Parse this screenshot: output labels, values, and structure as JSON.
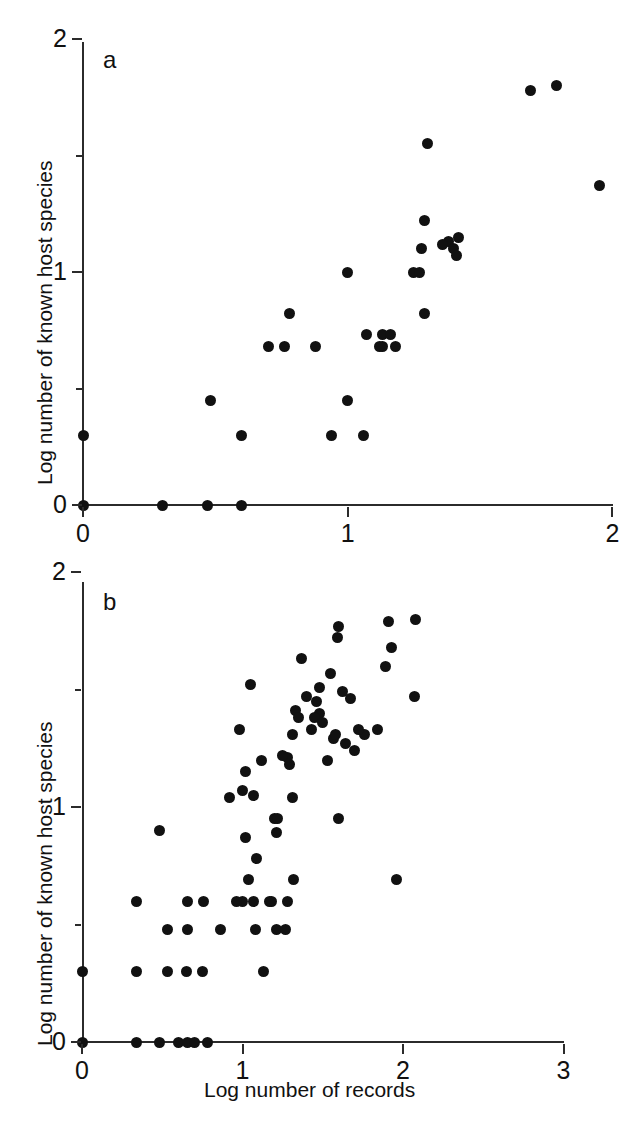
{
  "figure": {
    "axis_titles": {
      "x": "Log number of records",
      "y": "Log number of known host species"
    },
    "panel_labels": {
      "a": "a",
      "b": "b"
    }
  },
  "chart_data": [
    {
      "type": "scatter",
      "panel": "a",
      "title": "a",
      "xlabel": "",
      "ylabel": "Log number of known host species",
      "xlim": [
        0,
        2
      ],
      "ylim": [
        0,
        2
      ],
      "xticks": [
        0,
        1,
        2
      ],
      "xtick_labels": [
        "0",
        "1",
        "2"
      ],
      "yticks": [
        0,
        1,
        2
      ],
      "ytick_labels": [
        "0",
        "1",
        "2"
      ],
      "minor_yticks": [
        0.5,
        1.5
      ],
      "grid": false,
      "legend": false,
      "marker": "filled-circle",
      "marker_color": "#111111",
      "n_points": 35,
      "points": [
        [
          0.0,
          0.3
        ],
        [
          0.0,
          0.0
        ],
        [
          0.3,
          0.0
        ],
        [
          0.47,
          0.0
        ],
        [
          0.6,
          0.0
        ],
        [
          0.48,
          0.45
        ],
        [
          0.6,
          0.3
        ],
        [
          0.7,
          0.68
        ],
        [
          0.78,
          0.82
        ],
        [
          0.76,
          0.68
        ],
        [
          0.94,
          0.3
        ],
        [
          1.0,
          1.0
        ],
        [
          1.0,
          0.45
        ],
        [
          1.06,
          0.3
        ],
        [
          1.07,
          0.73
        ],
        [
          1.13,
          0.73
        ],
        [
          1.13,
          0.68
        ],
        [
          1.18,
          0.68
        ],
        [
          1.25,
          1.0
        ],
        [
          1.28,
          1.1
        ],
        [
          1.29,
          0.82
        ],
        [
          1.29,
          1.22
        ],
        [
          1.3,
          1.55
        ],
        [
          1.38,
          1.13
        ],
        [
          1.4,
          1.1
        ],
        [
          1.41,
          1.07
        ],
        [
          1.42,
          1.15
        ],
        [
          1.69,
          1.78
        ],
        [
          1.79,
          1.8
        ],
        [
          1.95,
          1.37
        ],
        [
          1.12,
          0.68
        ],
        [
          0.88,
          0.68
        ],
        [
          1.36,
          1.12
        ],
        [
          1.27,
          1.0
        ],
        [
          1.16,
          0.73
        ]
      ]
    },
    {
      "type": "scatter",
      "panel": "b",
      "title": "b",
      "xlabel": "Log number of records",
      "ylabel": "Log number of known host species",
      "xlim": [
        0,
        3
      ],
      "ylim": [
        0,
        2
      ],
      "xticks": [
        0,
        1,
        2,
        3
      ],
      "xtick_labels": [
        "0",
        "1",
        "2",
        "3"
      ],
      "yticks": [
        0,
        1,
        2
      ],
      "ytick_labels": [
        "0",
        "1",
        "2"
      ],
      "minor_yticks": [
        0.5,
        1.5
      ],
      "grid": false,
      "legend": false,
      "marker": "filled-circle",
      "marker_color": "#111111",
      "n_points": 78,
      "points": [
        [
          0.0,
          0.3
        ],
        [
          0.0,
          0.0
        ],
        [
          0.34,
          0.0
        ],
        [
          0.48,
          0.0
        ],
        [
          0.6,
          0.0
        ],
        [
          0.66,
          0.0
        ],
        [
          0.7,
          0.0
        ],
        [
          0.78,
          0.0
        ],
        [
          0.34,
          0.3
        ],
        [
          0.53,
          0.3
        ],
        [
          0.65,
          0.3
        ],
        [
          0.75,
          0.3
        ],
        [
          1.13,
          0.3
        ],
        [
          0.53,
          0.48
        ],
        [
          0.66,
          0.48
        ],
        [
          0.86,
          0.48
        ],
        [
          1.08,
          0.48
        ],
        [
          1.21,
          0.48
        ],
        [
          1.27,
          0.48
        ],
        [
          0.34,
          0.6
        ],
        [
          0.66,
          0.6
        ],
        [
          0.76,
          0.6
        ],
        [
          1.0,
          0.6
        ],
        [
          1.07,
          0.6
        ],
        [
          1.17,
          0.6
        ],
        [
          1.28,
          0.6
        ],
        [
          1.04,
          0.69
        ],
        [
          1.32,
          0.69
        ],
        [
          1.96,
          0.69
        ],
        [
          0.48,
          0.9
        ],
        [
          1.09,
          0.78
        ],
        [
          1.02,
          0.87
        ],
        [
          0.92,
          1.04
        ],
        [
          1.0,
          1.07
        ],
        [
          1.07,
          1.05
        ],
        [
          1.31,
          1.04
        ],
        [
          1.2,
          0.95
        ],
        [
          1.22,
          0.95
        ],
        [
          1.6,
          0.95
        ],
        [
          1.21,
          0.89
        ],
        [
          1.02,
          1.15
        ],
        [
          1.29,
          1.18
        ],
        [
          1.28,
          1.21
        ],
        [
          1.53,
          1.2
        ],
        [
          1.7,
          1.24
        ],
        [
          0.98,
          1.33
        ],
        [
          1.31,
          1.31
        ],
        [
          1.57,
          1.29
        ],
        [
          1.58,
          1.31
        ],
        [
          1.64,
          1.27
        ],
        [
          1.76,
          1.31
        ],
        [
          1.84,
          1.33
        ],
        [
          1.48,
          1.4
        ],
        [
          1.45,
          1.38
        ],
        [
          1.05,
          1.52
        ],
        [
          1.4,
          1.47
        ],
        [
          1.46,
          1.45
        ],
        [
          1.48,
          1.51
        ],
        [
          1.62,
          1.49
        ],
        [
          1.67,
          1.46
        ],
        [
          2.07,
          1.47
        ],
        [
          1.37,
          1.63
        ],
        [
          1.55,
          1.57
        ],
        [
          1.89,
          1.6
        ],
        [
          1.59,
          1.72
        ],
        [
          1.93,
          1.68
        ],
        [
          1.6,
          1.77
        ],
        [
          1.91,
          1.79
        ],
        [
          2.08,
          1.8
        ],
        [
          1.33,
          1.41
        ],
        [
          1.35,
          1.38
        ],
        [
          1.12,
          1.2
        ],
        [
          1.18,
          0.6
        ],
        [
          0.96,
          0.6
        ],
        [
          1.25,
          1.22
        ],
        [
          1.43,
          1.33
        ],
        [
          1.5,
          1.36
        ],
        [
          1.72,
          1.33
        ]
      ]
    }
  ]
}
